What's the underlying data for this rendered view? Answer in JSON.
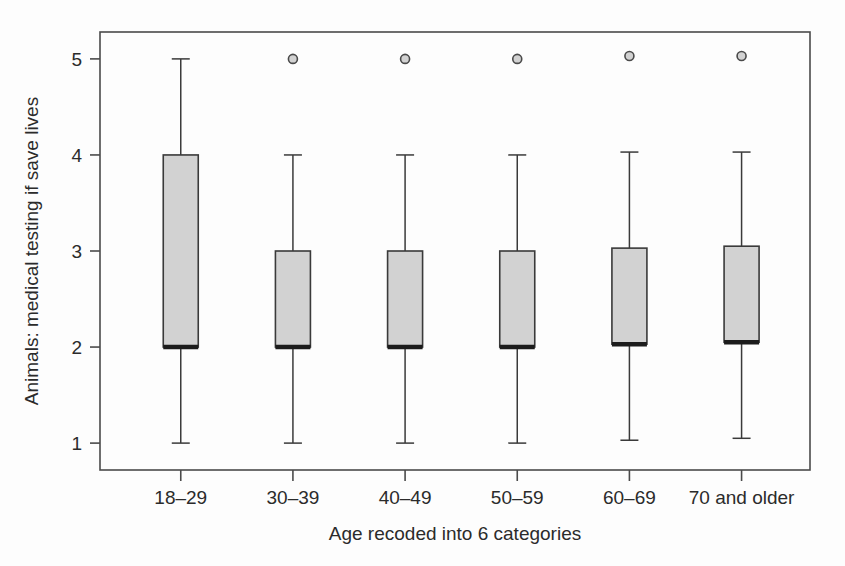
{
  "chart_data": {
    "type": "box",
    "title": "",
    "xlabel": "Age recoded into 6 categories",
    "ylabel": "Animals: medical testing if save lives",
    "categories": [
      "18–29",
      "30–39",
      "40–49",
      "50–59",
      "60–69",
      "70 and older"
    ],
    "ylim": [
      0.72,
      5.28
    ],
    "yticks": [
      1,
      2,
      3,
      4,
      5
    ],
    "ytick_labels": [
      "1",
      "2",
      "3",
      "4",
      "5"
    ],
    "grid": false,
    "legend": "none",
    "box_fill_color": "#d2d2d2",
    "box_edge_color": "#3a3a3a",
    "median_color": "#1c1c1c",
    "whisker_color": "#3a3a3a",
    "outlier_color": "#d2d2d2",
    "frame_color": "#4a4a4a",
    "boxes": [
      {
        "category": "18–29",
        "whisker_low": 1.0,
        "q1": 2.0,
        "median": 2.0,
        "q3": 4.0,
        "whisker_high": 5.0,
        "outliers": []
      },
      {
        "category": "30–39",
        "whisker_low": 1.0,
        "q1": 2.0,
        "median": 2.0,
        "q3": 3.0,
        "whisker_high": 4.0,
        "outliers": [
          5.0
        ]
      },
      {
        "category": "40–49",
        "whisker_low": 1.0,
        "q1": 2.0,
        "median": 2.0,
        "q3": 3.0,
        "whisker_high": 4.0,
        "outliers": [
          5.0
        ]
      },
      {
        "category": "50–59",
        "whisker_low": 1.0,
        "q1": 2.0,
        "median": 2.0,
        "q3": 3.0,
        "whisker_high": 4.0,
        "outliers": [
          5.0
        ]
      },
      {
        "category": "60–69",
        "whisker_low": 1.03,
        "q1": 2.03,
        "median": 2.03,
        "q3": 3.03,
        "whisker_high": 4.03,
        "outliers": [
          5.03
        ]
      },
      {
        "category": "70 and older",
        "whisker_low": 1.05,
        "q1": 2.05,
        "median": 2.05,
        "q3": 3.05,
        "whisker_high": 4.03,
        "outliers": [
          5.03
        ]
      }
    ]
  },
  "geometry": {
    "plot_left": 100,
    "plot_right": 810,
    "plot_top": 32,
    "plot_bottom": 470,
    "box_width": 35,
    "cap_half_width": 9,
    "outlier_radius": 4.5
  }
}
